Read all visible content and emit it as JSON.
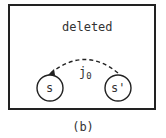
{
  "diagram": {
    "region_label": "deleted",
    "states": [
      {
        "id": "s",
        "label": "s"
      },
      {
        "id": "s_prime",
        "label": "s'"
      }
    ],
    "transition": {
      "label": "j",
      "subscript": "0",
      "from": "s'",
      "to": "s",
      "style": "dashed"
    },
    "caption": "(b)"
  }
}
